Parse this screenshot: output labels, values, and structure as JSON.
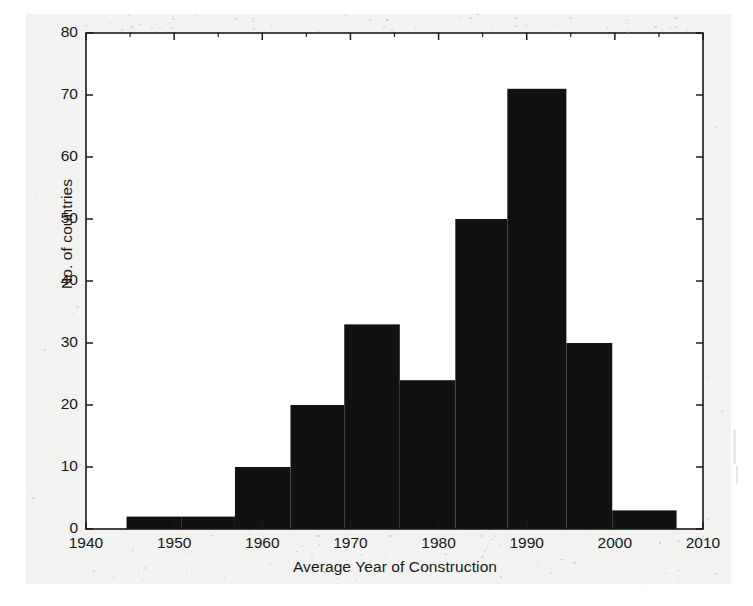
{
  "figure": {
    "background_color": "#f2f2f0",
    "plot_background_color": "#ffffff",
    "axis_color": "#1a1a1a",
    "bar_color": "#111111"
  },
  "chart_data": {
    "type": "bar",
    "title": "",
    "subtitle": "",
    "xlabel": "Average Year of Construction",
    "ylabel": "No. of countries",
    "xlim": [
      1940,
      2010
    ],
    "ylim": [
      0,
      80
    ],
    "grid": false,
    "legend": null,
    "bin_width": 6.2,
    "x_ticks": [
      1940,
      1950,
      1960,
      1970,
      1980,
      1990,
      2000,
      2010
    ],
    "x_tick_labels": [
      "1940",
      "1950",
      "1960",
      "1970",
      "1980",
      "1990",
      "2000",
      "2010"
    ],
    "x_minor_ticks": [
      1945,
      1955,
      1965,
      1975,
      1985,
      1995,
      2005
    ],
    "y_ticks": [
      0,
      10,
      20,
      30,
      40,
      50,
      60,
      70,
      80
    ],
    "y_tick_labels": [
      "0",
      "10",
      "20",
      "30",
      "40",
      "50",
      "60",
      "70",
      "80"
    ],
    "bins": [
      {
        "start": 1944.6,
        "end": 1950.8,
        "center": 1947.7,
        "value": 2
      },
      {
        "start": 1950.8,
        "end": 1956.9,
        "center": 1953.9,
        "value": 2
      },
      {
        "start": 1956.9,
        "end": 1963.2,
        "center": 1960.0,
        "value": 10
      },
      {
        "start": 1963.2,
        "end": 1969.3,
        "center": 1966.2,
        "value": 20
      },
      {
        "start": 1969.3,
        "end": 1975.6,
        "center": 1972.4,
        "value": 33
      },
      {
        "start": 1975.6,
        "end": 1981.9,
        "center": 1978.7,
        "value": 24
      },
      {
        "start": 1981.9,
        "end": 1987.8,
        "center": 1984.9,
        "value": 50
      },
      {
        "start": 1987.8,
        "end": 1994.5,
        "center": 1991.2,
        "value": 71
      },
      {
        "start": 1994.5,
        "end": 1999.7,
        "center": 1997.1,
        "value": 30
      },
      {
        "start": 1999.7,
        "end": 2007.0,
        "center": 2003.4,
        "value": 3
      }
    ],
    "categories": [
      "1947.7",
      "1953.9",
      "1960.0",
      "1966.2",
      "1972.4",
      "1978.7",
      "1984.9",
      "1991.2",
      "1997.1",
      "2003.4"
    ],
    "values": [
      2,
      2,
      10,
      20,
      33,
      24,
      50,
      71,
      30,
      3
    ]
  }
}
